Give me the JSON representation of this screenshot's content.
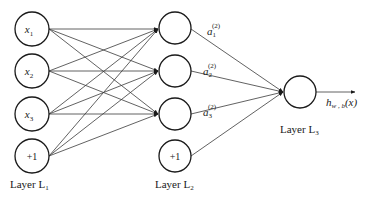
{
  "diagram": {
    "type": "feedforward-neural-network",
    "layers": [
      {
        "name": "Layer L1",
        "label_main": "Layer L",
        "label_sub": "1",
        "nodes": [
          {
            "label": "x",
            "sub": "1"
          },
          {
            "label": "x",
            "sub": "2"
          },
          {
            "label": "x",
            "sub": "3"
          },
          {
            "label": "+1",
            "sub": ""
          }
        ]
      },
      {
        "name": "Layer L2",
        "label_main": "Layer L",
        "label_sub": "2",
        "nodes": [
          {
            "label": "",
            "activation": "a",
            "sup": "(2)",
            "sub": "1"
          },
          {
            "label": "",
            "activation": "a",
            "sup": "(2)",
            "sub": "2"
          },
          {
            "label": "",
            "activation": "a",
            "sup": "(2)",
            "sub": "3"
          },
          {
            "label": "+1",
            "sub": ""
          }
        ]
      },
      {
        "name": "Layer L3",
        "label_main": "Layer L",
        "label_sub": "3",
        "nodes": [
          {
            "label": ""
          }
        ]
      }
    ],
    "output": {
      "main": "h",
      "sub": "w , b",
      "arg": "(x)"
    },
    "colors": {
      "stroke": "#1a1a1a",
      "edge": "#3a3a3a",
      "background": "#ffffff"
    }
  }
}
